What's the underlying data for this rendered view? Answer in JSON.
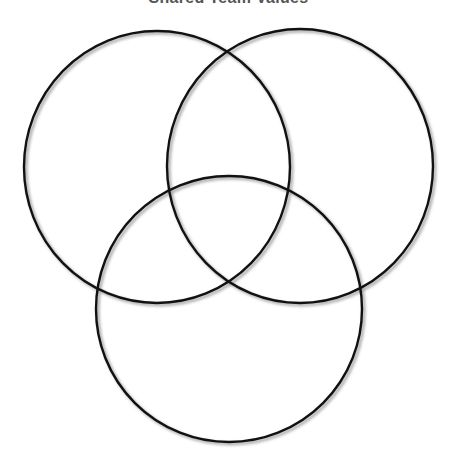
{
  "diagram": {
    "type": "venn",
    "title": "Shared Team Values",
    "title_clipped": true,
    "stroke_color": "#111111",
    "shadow_color": "#9a9a9a",
    "background": "#ffffff",
    "circles": [
      {
        "id": "top-left",
        "label": "",
        "cx": 157,
        "cy": 167,
        "rx": 133,
        "ry": 136
      },
      {
        "id": "top-right",
        "label": "",
        "cx": 300,
        "cy": 166,
        "rx": 133,
        "ry": 137
      },
      {
        "id": "bottom",
        "label": "",
        "cx": 229,
        "cy": 309,
        "rx": 133,
        "ry": 133
      }
    ]
  }
}
